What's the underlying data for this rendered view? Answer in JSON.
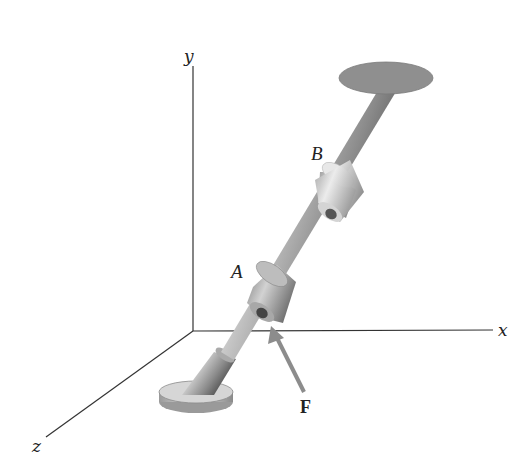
{
  "diagram": {
    "axes": {
      "x_label": "x",
      "y_label": "y",
      "z_label": "z"
    },
    "points": {
      "A": "A",
      "B": "B"
    },
    "force": {
      "label": "F",
      "color": "#8c8c8c"
    },
    "colors": {
      "axis": "#333333",
      "rod": "#8a8a8a",
      "collar": "#c8c8c8",
      "top_plate": "#8f8f8f",
      "base_plate": "#bdbdbd"
    }
  }
}
